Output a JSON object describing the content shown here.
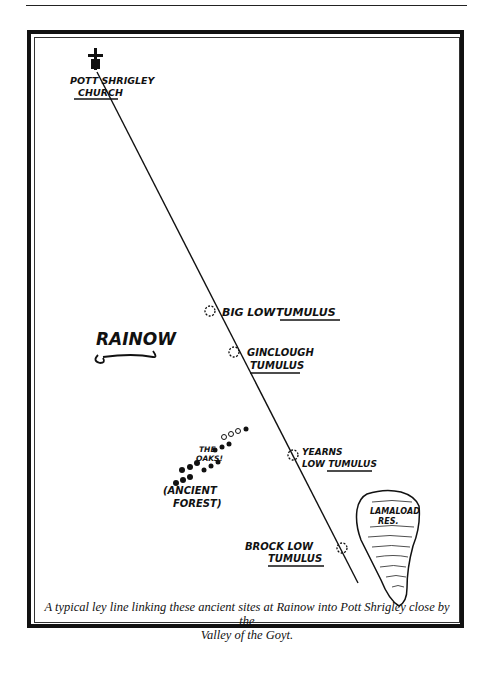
{
  "map": {
    "church": {
      "line1": "POTT SHRIGLEY",
      "line2": "CHURCH",
      "icon": "church-cross-icon"
    },
    "village": {
      "label": "RAINOW"
    },
    "sites": [
      {
        "name": "BIG LOW TUMULUS",
        "line1": "BIG LOW",
        "line2": "TUMULUS"
      },
      {
        "name": "GINCLOUGH TUMULUS",
        "line1": "GINCLOUGH",
        "line2": "TUMULUS"
      },
      {
        "name": "YEARNS LOW TUMULUS",
        "line1": "YEARNS",
        "line2": "LOW TUMULUS"
      },
      {
        "name": "BROCK LOW TUMULUS",
        "line1": "BROCK LOW",
        "line2": "TUMULUS"
      }
    ],
    "forest": {
      "line1": "THE",
      "line2": "OAKS!",
      "line3": "(ANCIENT",
      "line4": "FOREST)"
    },
    "reservoir": {
      "line1": "LAMALOAD",
      "line2": "RES."
    },
    "ley_line": {
      "start": [
        97,
        72
      ],
      "end": [
        358,
        583
      ]
    }
  },
  "caption": {
    "line1": "A typical ley line linking these ancient sites at Rainow into Pott Shrigley close by the",
    "line2": "Valley of the Goyt."
  }
}
